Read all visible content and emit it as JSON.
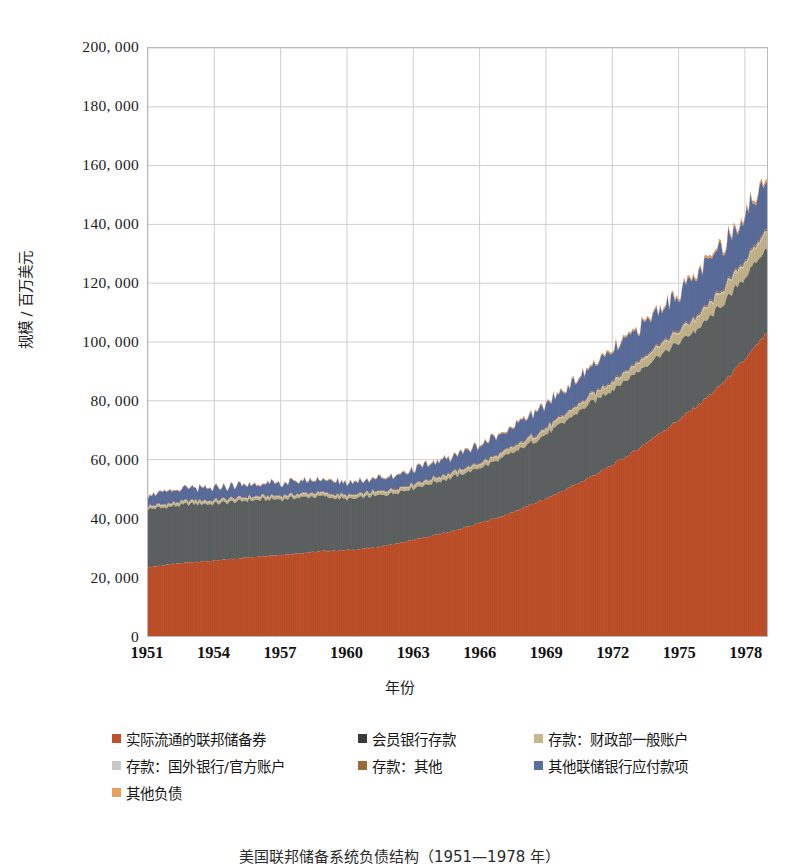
{
  "chart_data": {
    "type": "area",
    "stacked": true,
    "title": "",
    "xlabel": "年份",
    "ylabel": "规模 / 百万美元",
    "xlim": [
      1951,
      1979
    ],
    "ylim": [
      0,
      200000
    ],
    "ytick_labels": [
      "200, 000",
      "180, 000",
      "160, 000",
      "140, 000",
      "120, 000",
      "100, 000",
      "80, 000",
      "60, 000",
      "40, 000",
      "20, 000",
      "0"
    ],
    "ytick_values": [
      200000,
      180000,
      160000,
      140000,
      120000,
      100000,
      80000,
      60000,
      40000,
      20000,
      0
    ],
    "xtick_labels": [
      "1951",
      "1954",
      "1957",
      "1960",
      "1963",
      "1966",
      "1969",
      "1972",
      "1975",
      "1978"
    ],
    "xtick_values": [
      1951,
      1954,
      1957,
      1960,
      1963,
      1966,
      1969,
      1972,
      1975,
      1978
    ],
    "grid": true,
    "grid_color": "#cfcfcf",
    "legend_position": "bottom",
    "x": [
      1951,
      1952,
      1953,
      1954,
      1955,
      1956,
      1957,
      1958,
      1959,
      1960,
      1961,
      1962,
      1963,
      1964,
      1965,
      1966,
      1967,
      1968,
      1969,
      1970,
      1971,
      1972,
      1973,
      1974,
      1975,
      1976,
      1977,
      1978,
      1979
    ],
    "series": [
      {
        "name": "实际流通的联邦储备券",
        "color": "#C0502A",
        "values": [
          23400,
          24300,
          25200,
          25600,
          26300,
          27100,
          27600,
          28200,
          28900,
          29200,
          29800,
          31000,
          32600,
          34300,
          36100,
          38400,
          40700,
          43600,
          46700,
          50200,
          54000,
          58100,
          62800,
          68200,
          73500,
          79200,
          86000,
          94000,
          103000
        ]
      },
      {
        "name": "会员银行存款",
        "color": "#5D6262",
        "values": [
          19800,
          19600,
          19800,
          19300,
          19500,
          19300,
          19000,
          19100,
          18500,
          17200,
          17600,
          17400,
          17600,
          18000,
          18400,
          18700,
          19700,
          20600,
          21800,
          23400,
          25100,
          25600,
          26200,
          26700,
          26200,
          26000,
          26800,
          27800,
          28500
        ]
      },
      {
        "name": "存款：财政部一般账户",
        "color": "#C5B68C",
        "values": [
          700,
          750,
          800,
          780,
          820,
          800,
          790,
          850,
          880,
          900,
          950,
          1000,
          1050,
          1100,
          1150,
          1200,
          1350,
          1500,
          1700,
          1900,
          2100,
          2400,
          2700,
          3000,
          3400,
          3800,
          4300,
          4900,
          5400
        ]
      },
      {
        "name": "存款：国外银行/官方账户",
        "color": "#C8C8C8",
        "values": [
          180,
          190,
          200,
          195,
          205,
          200,
          210,
          215,
          220,
          225,
          230,
          240,
          250,
          255,
          265,
          275,
          290,
          300,
          320,
          340,
          360,
          380,
          400,
          430,
          450,
          470,
          500,
          530,
          560
        ]
      },
      {
        "name": "存款：其他",
        "color": "#9A6A3A",
        "values": [
          220,
          230,
          240,
          235,
          245,
          240,
          250,
          255,
          260,
          270,
          280,
          290,
          300,
          310,
          320,
          335,
          350,
          370,
          390,
          410,
          430,
          460,
          490,
          520,
          550,
          580,
          620,
          660,
          700
        ]
      },
      {
        "name": "其他联储银行应付款项",
        "color": "#5A6E9E",
        "values": [
          3800,
          3900,
          4000,
          3950,
          4050,
          4100,
          4000,
          4200,
          4300,
          4100,
          4300,
          4500,
          4800,
          5100,
          5500,
          5900,
          6400,
          7000,
          7600,
          8300,
          9000,
          9800,
          10600,
          11500,
          12400,
          13300,
          14300,
          15400,
          16300
        ]
      },
      {
        "name": "其他负债",
        "color": "#E8A05C",
        "values": [
          260,
          270,
          280,
          275,
          285,
          290,
          295,
          300,
          310,
          315,
          325,
          340,
          355,
          370,
          390,
          410,
          440,
          470,
          500,
          540,
          580,
          630,
          680,
          740,
          800,
          870,
          940,
          1020,
          1100
        ]
      }
    ]
  },
  "legend": {
    "rows": [
      [
        {
          "label": "实际流通的联邦储备券",
          "color": "#C0502A",
          "left": 0
        },
        {
          "label": "会员银行存款",
          "color": "#3A3A38",
          "left": 246
        },
        {
          "label": "存款：财政部一般账户",
          "color": "#C5B68C",
          "left": 422
        }
      ],
      [
        {
          "label": "存款：国外银行/官方账户",
          "color": "#C8C8C8",
          "left": 0
        },
        {
          "label": "存款：其他",
          "color": "#9A6A3A",
          "left": 246
        },
        {
          "label": "其他联储银行应付款项",
          "color": "#5A6E9E",
          "left": 422
        }
      ],
      [
        {
          "label": "其他负债",
          "color": "#E8A05C",
          "left": 0
        }
      ]
    ]
  },
  "caption": {
    "text": "美国联邦储备系统负债结构（1951—1978 年）"
  }
}
